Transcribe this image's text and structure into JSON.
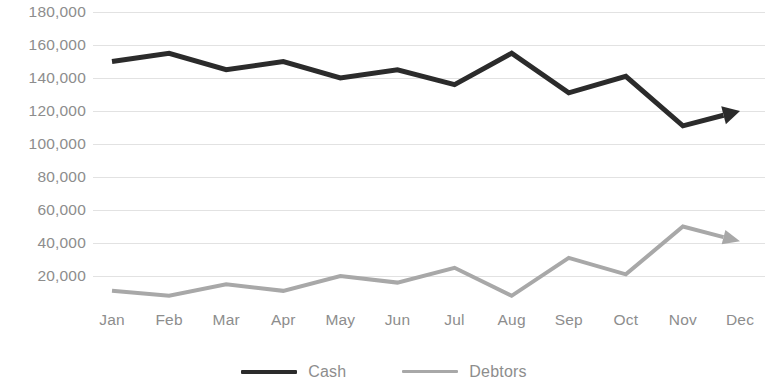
{
  "chart_data": {
    "type": "line",
    "title": "",
    "subtitle": "",
    "xlabel": "",
    "ylabel": "",
    "categories": [
      "Jan",
      "Feb",
      "Mar",
      "Apr",
      "May",
      "Jun",
      "Jul",
      "Aug",
      "Sep",
      "Oct",
      "Nov",
      "Dec"
    ],
    "ylim": [
      0,
      180000
    ],
    "ytick_labels": [
      "180,000",
      "160,000",
      "140,000",
      "120,000",
      "100,000",
      "80,000",
      "60,000",
      "40,000",
      "20,000"
    ],
    "ytick_values": [
      180000,
      160000,
      140000,
      120000,
      100000,
      80000,
      60000,
      40000,
      20000
    ],
    "grid": true,
    "grid_axis": "y",
    "legend_position": "bottom",
    "series": [
      {
        "name": "Cash",
        "color": "#2b2b2b",
        "line_width": 5,
        "arrow_end": true,
        "values": [
          150000,
          155000,
          145000,
          150000,
          140000,
          145000,
          136000,
          155000,
          131000,
          141000,
          111000,
          120000
        ]
      },
      {
        "name": "Debtors",
        "color": "#a8a8a8",
        "line_width": 4,
        "arrow_end": true,
        "values": [
          11000,
          8000,
          15000,
          11000,
          20000,
          16000,
          25000,
          8000,
          31000,
          21000,
          50000,
          41000
        ]
      }
    ]
  },
  "axis": {
    "tick_color": "#8d8d8d",
    "grid_color": "#e2e2e2"
  },
  "legend": {
    "items": [
      {
        "label": "Cash",
        "color": "#2b2b2b"
      },
      {
        "label": "Debtors",
        "color": "#a8a8a8"
      }
    ]
  }
}
